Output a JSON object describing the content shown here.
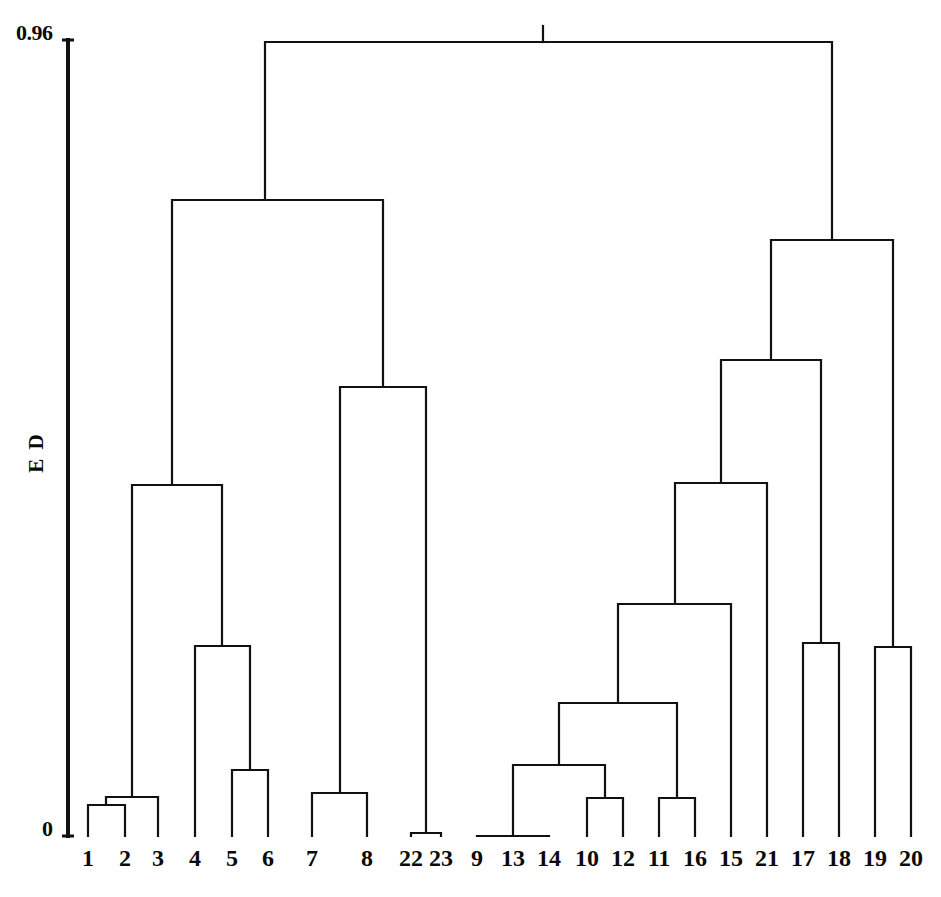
{
  "figure": {
    "type": "dendrogram",
    "background_color": "#ffffff",
    "line_color": "#111111"
  },
  "axis": {
    "title": "E D",
    "top_tick_label": "0.96",
    "bottom_tick_label": "0",
    "range_min": 0,
    "range_max": 0.96
  },
  "chart_data": {
    "type": "dendrogram",
    "title": "",
    "xlabel": "",
    "ylabel": "E D",
    "ylim": [
      0,
      0.96
    ],
    "ytick_labels": [
      "0",
      "0.96"
    ],
    "grid": false,
    "legend": "none",
    "n_leaves": 23,
    "leaf_order": [
      "1",
      "2",
      "3",
      "4",
      "5",
      "6",
      "7",
      "8",
      "22",
      "23",
      "9",
      "13",
      "14",
      "10",
      "12",
      "11",
      "16",
      "15",
      "21",
      "17",
      "18",
      "19",
      "20"
    ],
    "leaf_positions_px": [
      88,
      125,
      158,
      195,
      232,
      268,
      312,
      367,
      411,
      441,
      477,
      513,
      549,
      587,
      623,
      659,
      695,
      731,
      767,
      803,
      839,
      875,
      911
    ],
    "baseline_y_px": 836,
    "top_y_px": 42,
    "merges": [
      {
        "id": "m1",
        "left": "1",
        "right": "2",
        "height_px": 805,
        "height_ed": 0.038,
        "x_px": 106
      },
      {
        "id": "m2",
        "left": "m1",
        "right": "3",
        "height_px": 797,
        "height_ed": 0.049,
        "x_px": 132
      },
      {
        "id": "m3",
        "left": "5",
        "right": "6",
        "height_px": 770,
        "height_ed": 0.083,
        "x_px": 250
      },
      {
        "id": "m4",
        "left": "4",
        "right": "m3",
        "height_px": 646,
        "height_ed": 0.239,
        "x_px": 222
      },
      {
        "id": "m5",
        "left": "m2",
        "right": "m4",
        "height_px": 485,
        "height_ed": 0.442,
        "x_px": 172
      },
      {
        "id": "m6",
        "left": "7",
        "right": "8",
        "height_px": 793,
        "height_ed": 0.054,
        "x_px": 340
      },
      {
        "id": "m7",
        "left": "22",
        "right": "23",
        "height_px": 833,
        "height_ed": 0.004,
        "x_px": 426
      },
      {
        "id": "m8",
        "left": "m6",
        "right": "m7",
        "height_px": 387,
        "height_ed": 0.565,
        "x_px": 383
      },
      {
        "id": "m9",
        "left": "m5",
        "right": "m8",
        "height_px": 200,
        "height_ed": 0.8,
        "x_px": 265
      },
      {
        "id": "m10",
        "left": "9",
        "right": "13",
        "height_px": 836,
        "height_ed": 0.0,
        "x_px": 513
      },
      {
        "id": "m11",
        "left": "m10",
        "right": "14",
        "height_px": 836,
        "height_ed": 0.0,
        "x_px": 513
      },
      {
        "id": "m12",
        "left": "10",
        "right": "12",
        "height_px": 798,
        "height_ed": 0.048,
        "x_px": 605
      },
      {
        "id": "m13",
        "left": "m11",
        "right": "m12",
        "height_px": 765,
        "height_ed": 0.089,
        "x_px": 559
      },
      {
        "id": "m14",
        "left": "11",
        "right": "16",
        "height_px": 798,
        "height_ed": 0.048,
        "x_px": 677
      },
      {
        "id": "m15",
        "left": "m13",
        "right": "m14",
        "height_px": 703,
        "height_ed": 0.167,
        "x_px": 618
      },
      {
        "id": "m16",
        "left": "m15",
        "right": "15",
        "height_px": 604,
        "height_ed": 0.291,
        "x_px": 675
      },
      {
        "id": "m17",
        "left": "m16",
        "right": "21",
        "height_px": 483,
        "height_ed": 0.444,
        "x_px": 721
      },
      {
        "id": "m18",
        "left": "17",
        "right": "18",
        "height_px": 643,
        "height_ed": 0.243,
        "x_px": 821
      },
      {
        "id": "m19",
        "left": "m17",
        "right": "m18",
        "height_px": 360,
        "height_ed": 0.599,
        "x_px": 771
      },
      {
        "id": "m20",
        "left": "19",
        "right": "20",
        "height_px": 647,
        "height_ed": 0.238,
        "x_px": 893
      },
      {
        "id": "m21",
        "left": "m19",
        "right": "m20",
        "height_px": 240,
        "height_ed": 0.746,
        "x_px": 832
      },
      {
        "id": "m22",
        "left": "m9",
        "right": "m21",
        "height_px": 42,
        "height_ed": 0.96,
        "x_px": 543
      }
    ],
    "clusters_described": [
      {
        "name": "A",
        "members": [
          "1",
          "2",
          "3"
        ]
      },
      {
        "name": "B",
        "members": [
          "4",
          "5",
          "6"
        ]
      },
      {
        "name": "C",
        "members": [
          "7",
          "8"
        ]
      },
      {
        "name": "D",
        "members": [
          "22",
          "23"
        ]
      },
      {
        "name": "E",
        "members": [
          "9",
          "13",
          "14"
        ]
      },
      {
        "name": "F",
        "members": [
          "10",
          "12"
        ]
      },
      {
        "name": "G",
        "members": [
          "11",
          "16"
        ]
      },
      {
        "name": "H",
        "members": [
          "15",
          "21"
        ]
      },
      {
        "name": "I",
        "members": [
          "17",
          "18"
        ]
      },
      {
        "name": "J",
        "members": [
          "19",
          "20"
        ]
      }
    ]
  },
  "leaf_labels": [
    {
      "text": "1",
      "x": 88
    },
    {
      "text": "2",
      "x": 125
    },
    {
      "text": "3",
      "x": 158
    },
    {
      "text": "4",
      "x": 195
    },
    {
      "text": "5",
      "x": 232
    },
    {
      "text": "6",
      "x": 268
    },
    {
      "text": "7",
      "x": 312
    },
    {
      "text": "8",
      "x": 367
    },
    {
      "text": "22",
      "x": 411
    },
    {
      "text": "23",
      "x": 441
    },
    {
      "text": "9",
      "x": 477
    },
    {
      "text": "13",
      "x": 513
    },
    {
      "text": "14",
      "x": 549
    },
    {
      "text": "10",
      "x": 587
    },
    {
      "text": "12",
      "x": 623
    },
    {
      "text": "11",
      "x": 659
    },
    {
      "text": "16",
      "x": 695
    },
    {
      "text": "15",
      "x": 731
    },
    {
      "text": "21",
      "x": 767
    },
    {
      "text": "17",
      "x": 803
    },
    {
      "text": "18",
      "x": 839
    },
    {
      "text": "19",
      "x": 875
    },
    {
      "text": "20",
      "x": 911
    }
  ]
}
